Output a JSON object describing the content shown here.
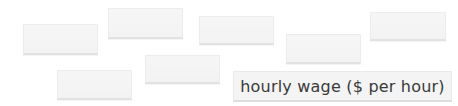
{
  "cards": [
    {
      "id": "card-1",
      "text": ""
    },
    {
      "id": "card-2",
      "text": ""
    },
    {
      "id": "card-3",
      "text": ""
    },
    {
      "id": "card-4",
      "text": ""
    },
    {
      "id": "card-5",
      "text": ""
    },
    {
      "id": "card-6",
      "text": ""
    },
    {
      "id": "card-7",
      "text": ""
    }
  ],
  "label_card": {
    "text": "hourly wage ($ per hour)"
  }
}
